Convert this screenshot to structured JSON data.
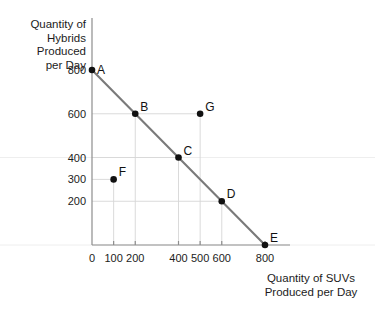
{
  "chart_data": {
    "type": "scatter",
    "title": "",
    "xlabel": "Quantity of SUVs Produced per Day",
    "ylabel": "Quantity of Hybrids Produced per Day",
    "xlim": [
      0,
      900
    ],
    "ylim": [
      0,
      880
    ],
    "grid": true,
    "legend": "none",
    "xticks": [
      {
        "value": 0,
        "label": "0"
      },
      {
        "value": 100,
        "label": "100"
      },
      {
        "value": 200,
        "label": "200"
      },
      {
        "value": 400,
        "label": "400"
      },
      {
        "value": 500,
        "label": "500"
      },
      {
        "value": 600,
        "label": "600"
      },
      {
        "value": 800,
        "label": "800"
      }
    ],
    "yticks": [
      {
        "value": 200,
        "label": "200"
      },
      {
        "value": 300,
        "label": "300"
      },
      {
        "value": 400,
        "label": "400"
      },
      {
        "value": 600,
        "label": "600"
      },
      {
        "value": 800,
        "label": "800"
      }
    ],
    "series": [
      {
        "name": "Production Possibilities Frontier",
        "type": "line",
        "points": [
          {
            "x": 0,
            "y": 800
          },
          {
            "x": 800,
            "y": 0
          }
        ]
      }
    ],
    "points": [
      {
        "label": "A",
        "x": 0,
        "y": 800,
        "label_pos": "right",
        "on_frontier": true
      },
      {
        "label": "B",
        "x": 200,
        "y": 600,
        "label_pos": "upper-right",
        "on_frontier": true
      },
      {
        "label": "C",
        "x": 400,
        "y": 400,
        "label_pos": "upper-right",
        "on_frontier": true
      },
      {
        "label": "D",
        "x": 600,
        "y": 200,
        "label_pos": "upper-right",
        "on_frontier": true
      },
      {
        "label": "E",
        "x": 800,
        "y": 0,
        "label_pos": "upper-right",
        "on_frontier": true
      },
      {
        "label": "F",
        "x": 100,
        "y": 300,
        "label_pos": "upper-right",
        "on_frontier": false
      },
      {
        "label": "G",
        "x": 500,
        "y": 600,
        "label_pos": "upper-right",
        "on_frontier": false
      }
    ]
  },
  "axis_titles": {
    "y_lines": [
      "Quantity of",
      "Hybrids",
      "Produced",
      "per Day"
    ],
    "x_lines": [
      "Quantity of SUVs",
      "Produced per Day"
    ]
  },
  "colors": {
    "frontier": "#7a7a7a",
    "point": "#111111",
    "axis": "#8d8d8d",
    "grid": "#d6d6d6",
    "text": "#1c1c1c",
    "background": "#ffffff"
  }
}
